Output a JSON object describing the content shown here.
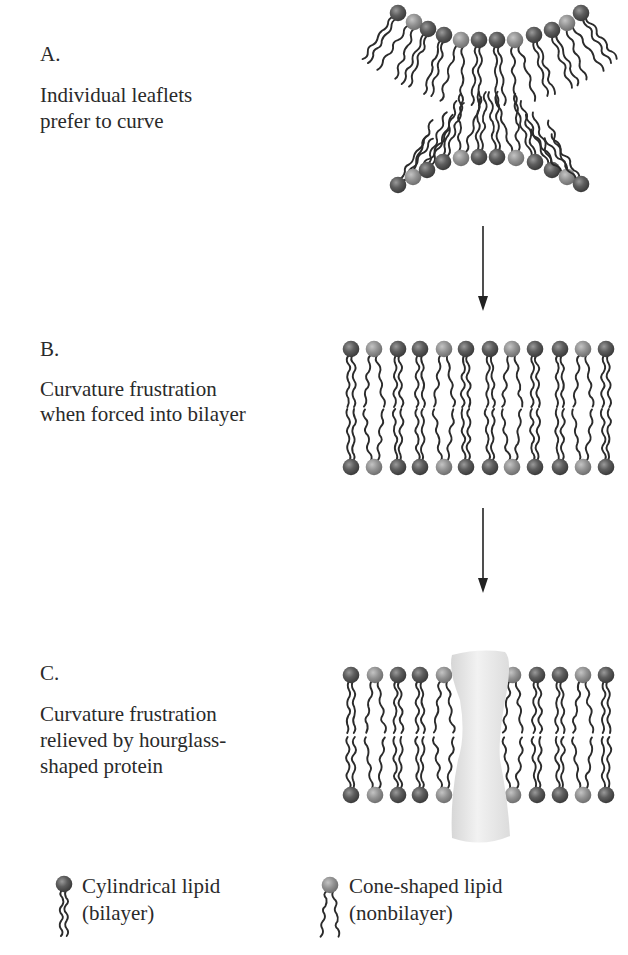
{
  "panels": [
    {
      "letter": "A.",
      "caption_line1": "Individual leaflets",
      "caption_line2": "prefer to curve"
    },
    {
      "letter": "B.",
      "caption_line1": "Curvature frustration",
      "caption_line2": "when forced into bilayer"
    },
    {
      "letter": "C.",
      "caption_line1": "Curvature frustration",
      "caption_line2": "relieved by hourglass-",
      "caption_line3": "shaped protein"
    }
  ],
  "legend": [
    {
      "icon": "cylindrical-lipid-icon",
      "line1": "Cylindrical lipid",
      "line2": "(bilayer)",
      "head_color": "#555555"
    },
    {
      "icon": "cone-shaped-lipid-icon",
      "line1": "Cone-shaped lipid",
      "line2": "(nonbilayer)",
      "head_color": "#8c8c8c"
    }
  ],
  "colors": {
    "dark_head": "#545454",
    "light_head": "#8e8e8e",
    "tail": "#2b2b2b",
    "protein": "#e6e6e6",
    "arrow": "#222222"
  },
  "pattern": [
    "d",
    "l",
    "d",
    "d",
    "l",
    "d",
    "d",
    "l",
    "d",
    "d",
    "l",
    "d"
  ],
  "panelC_pattern": [
    "d",
    "l",
    "d",
    "d",
    "l",
    "l",
    "d",
    "d",
    "l",
    "d"
  ]
}
